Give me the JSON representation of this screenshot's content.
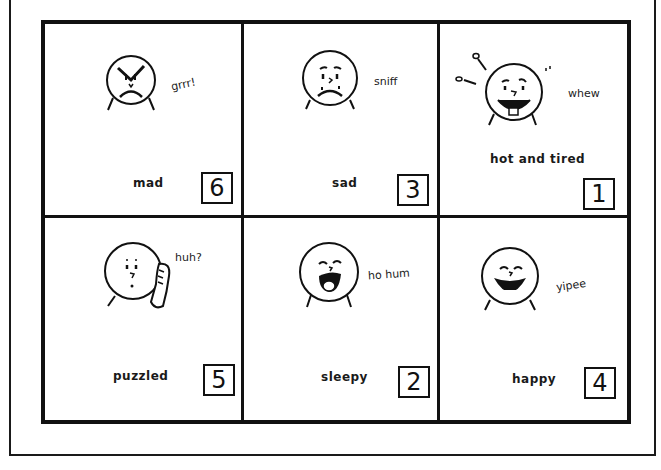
{
  "cards": [
    {
      "emotion": "mad",
      "sound": "grrr!",
      "number": "6",
      "face": "angry-face-icon"
    },
    {
      "emotion": "sad",
      "sound": "sniff",
      "number": "3",
      "face": "sad-face-icon"
    },
    {
      "emotion": "hot and tired",
      "sound": "whew",
      "number": "1",
      "face": "hot-tired-face-icon"
    },
    {
      "emotion": "puzzled",
      "sound": "huh?",
      "number": "5",
      "face": "puzzled-face-icon"
    },
    {
      "emotion": "sleepy",
      "sound": "ho hum",
      "number": "2",
      "face": "sleepy-face-icon"
    },
    {
      "emotion": "happy",
      "sound": "yipee",
      "number": "4",
      "face": "happy-face-icon"
    }
  ],
  "colors": {
    "ink": "#111111",
    "paper": "#ffffff"
  }
}
